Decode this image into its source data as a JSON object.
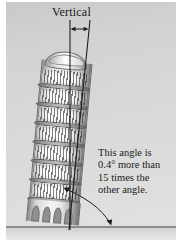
{
  "figure": {
    "background_color": "#d6d6d6",
    "ground_color": "#8d8d8d",
    "ink_color": "#1b1b1b"
  },
  "labels": {
    "vertical": "Vertical"
  },
  "annotation": {
    "lines": [
      "This angle is",
      "0.4° more than",
      "15 times the",
      "other angle."
    ],
    "full_text": "This angle is 0.4° more than 15 times the other angle."
  },
  "geometry": {
    "vertical_line_name": "vertical-reference-line",
    "tower_axis_line_name": "tower-axis-line",
    "top_gap_arrow": "double-headed-horizontal-arrow",
    "bottom_angle_arrow": "double-headed-curved-angle-arrow",
    "lean_angle_degrees": 5.2
  },
  "tower": {
    "name": "leaning-tower",
    "colonnade_tiers": 6,
    "base_arches": 4
  }
}
